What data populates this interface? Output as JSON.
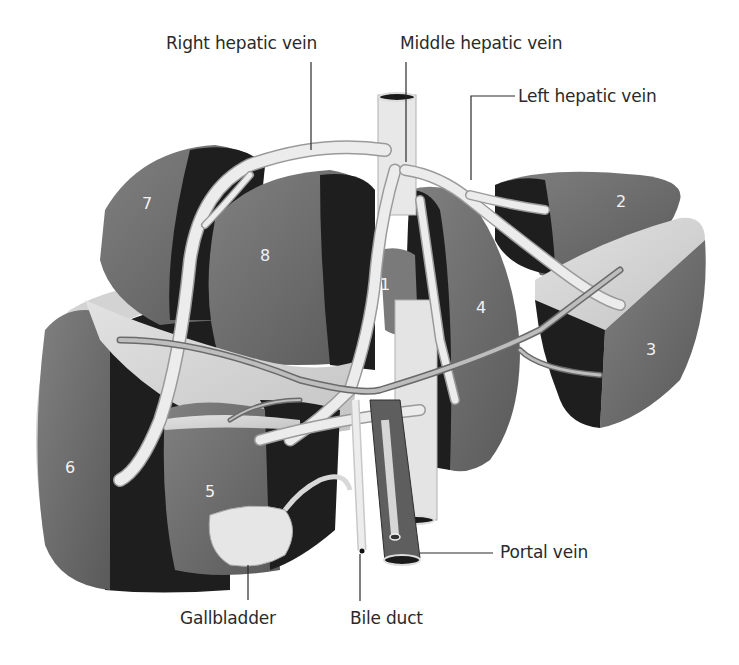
{
  "figure": {
    "palette": {
      "background": "#ffffff",
      "segment_face": "#6e6e6e",
      "segment_dark": "#1f1f1f",
      "cut_surface": "#d6d6d6",
      "vessel": "#e8e8e8",
      "vessel_outline": "#9a9a9a",
      "label_text": "#2a2a2a",
      "segment_number": "#f2f2f2"
    }
  },
  "labels": {
    "right_hepatic_vein": "Right hepatic vein",
    "middle_hepatic_vein": "Middle hepatic vein",
    "left_hepatic_vein": "Left hepatic vein",
    "portal_vein": "Portal vein",
    "gallbladder": "Gallbladder",
    "bile_duct": "Bile duct"
  },
  "segments": [
    {
      "number": "1"
    },
    {
      "number": "2"
    },
    {
      "number": "3"
    },
    {
      "number": "4"
    },
    {
      "number": "5"
    },
    {
      "number": "6"
    },
    {
      "number": "7"
    },
    {
      "number": "8"
    }
  ]
}
